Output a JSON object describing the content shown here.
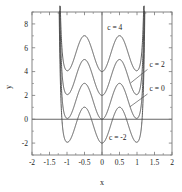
{
  "chart_data": {
    "type": "line",
    "title": "",
    "xlabel": "x",
    "ylabel": "y",
    "xlim": [
      -2,
      2
    ],
    "ylim": [
      -3,
      9
    ],
    "grid": false,
    "legend_position": "inline-annotations",
    "xticks": [
      -2,
      -1.5,
      -1,
      -0.5,
      0,
      0.5,
      1,
      1.5,
      2
    ],
    "xticklabels": [
      "-2",
      "-1.5",
      "-1",
      "-0.5",
      "0",
      "0.5",
      "1",
      "1.5",
      "2"
    ],
    "yticks": [
      -2,
      0,
      2,
      4,
      6,
      8
    ],
    "yticklabels": [
      "-2",
      "0",
      "2",
      "4",
      "6",
      "8"
    ],
    "axis_lines": {
      "x_zero": 0,
      "y_zero": 0
    },
    "series": [
      {
        "name": "c = 4",
        "c": 4,
        "label": "c = 4",
        "label_x": 0.15,
        "label_y": 7.45,
        "leader": false,
        "key_points": {
          "center_min": {
            "x": 0,
            "y": 4
          },
          "maxima": [
            {
              "x": -0.62,
              "y": 7.0
            },
            {
              "x": 0.62,
              "y": 7.0
            }
          ],
          "side_minima": [
            {
              "x": -1.0,
              "y": 5.05
            },
            {
              "x": 1.0,
              "y": 5.05
            }
          ],
          "walls": [
            {
              "x": -1.25
            },
            {
              "x": 1.25
            }
          ]
        }
      },
      {
        "name": "c = 2",
        "c": 2,
        "label": "c = 2",
        "label_x": 1.36,
        "label_y": 4.4,
        "leader": true,
        "key_points": {
          "center_min": {
            "x": 0,
            "y": 2
          },
          "maxima": [
            {
              "x": -0.62,
              "y": 5.0
            },
            {
              "x": 0.62,
              "y": 5.0
            }
          ],
          "side_minima": [
            {
              "x": -1.0,
              "y": 3.05
            },
            {
              "x": 1.0,
              "y": 3.05
            }
          ],
          "walls": [
            {
              "x": -1.25
            },
            {
              "x": 1.25
            }
          ]
        }
      },
      {
        "name": "c = 0",
        "c": 0,
        "label": "c = 0",
        "label_x": 1.36,
        "label_y": 2.35,
        "leader": true,
        "key_points": {
          "center_min": {
            "x": 0,
            "y": 0
          },
          "maxima": [
            {
              "x": -0.62,
              "y": 3.0
            },
            {
              "x": 0.62,
              "y": 3.0
            }
          ],
          "side_minima": [
            {
              "x": -1.0,
              "y": 1.05
            },
            {
              "x": 1.0,
              "y": 1.05
            }
          ],
          "walls": [
            {
              "x": -1.25
            },
            {
              "x": 1.25
            }
          ]
        }
      },
      {
        "name": "c = -2",
        "c": -2,
        "label": "c = -2",
        "label_x": 0.2,
        "label_y": -1.75,
        "leader": false,
        "key_points": {
          "center_min": {
            "x": 0,
            "y": -2
          },
          "maxima": [
            {
              "x": -0.62,
              "y": 1.0
            },
            {
              "x": 0.62,
              "y": 1.0
            }
          ],
          "side_minima": [
            {
              "x": -1.0,
              "y": -0.95
            },
            {
              "x": 1.0,
              "y": -0.95
            }
          ],
          "walls": [
            {
              "x": -1.25
            },
            {
              "x": 1.25
            }
          ]
        }
      }
    ],
    "colors": {
      "curve": "#4d4d4d",
      "axis": "#555555",
      "frame": "#777777",
      "text": "#1a1a1a",
      "background": "#ffffff"
    }
  }
}
